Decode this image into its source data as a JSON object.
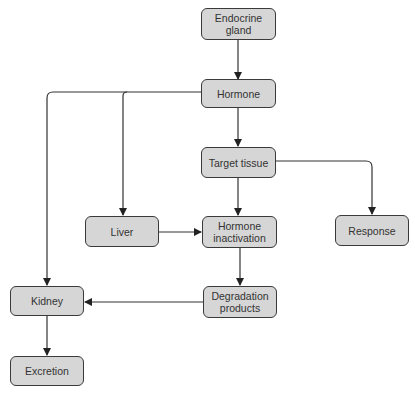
{
  "diagram": {
    "type": "flowchart",
    "colors": {
      "node_fill": "#d6d6d6",
      "node_border": "#3a3a3a",
      "line": "#333333",
      "text": "#333333"
    },
    "nodes": {
      "endocrine_gland": "Endocrine\ngland",
      "hormone": "Hormone",
      "target_tissue": "Target tissue",
      "liver": "Liver",
      "hormone_inactivation": "Hormone\ninactivation",
      "response": "Response",
      "kidney": "Kidney",
      "degradation_products": "Degradation\nproducts",
      "excretion": "Excretion"
    },
    "edges": [
      {
        "from": "Endocrine gland",
        "to": "Hormone"
      },
      {
        "from": "Hormone",
        "to": "Target tissue"
      },
      {
        "from": "Hormone",
        "to": "Liver"
      },
      {
        "from": "Hormone",
        "to": "Kidney"
      },
      {
        "from": "Target tissue",
        "to": "Hormone inactivation"
      },
      {
        "from": "Target tissue",
        "to": "Response"
      },
      {
        "from": "Liver",
        "to": "Hormone inactivation"
      },
      {
        "from": "Hormone inactivation",
        "to": "Degradation products"
      },
      {
        "from": "Degradation products",
        "to": "Kidney"
      },
      {
        "from": "Kidney",
        "to": "Excretion"
      }
    ]
  }
}
